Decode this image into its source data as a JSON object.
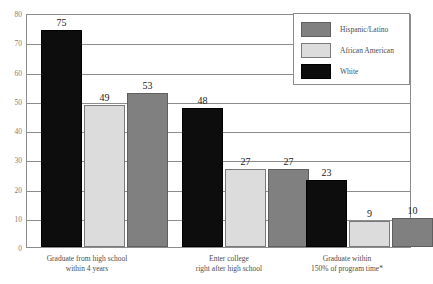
{
  "chart_data": {
    "type": "bar",
    "title": "",
    "xlabel": "",
    "ylabel": "",
    "ylim": [
      0,
      80
    ],
    "yticks": [
      0,
      10,
      20,
      30,
      40,
      50,
      60,
      70,
      80
    ],
    "grid": true,
    "legend_position": "top-right",
    "categories": [
      "Graduate from high school\nwithin 4 years",
      "Enter college\nright after high school",
      "Graduate within\n150% of program time*"
    ],
    "category_lines": [
      [
        "Graduate from high school",
        "within 4 years"
      ],
      [
        "Enter college",
        "right after high school"
      ],
      [
        "Graduate within",
        "150% of program time*"
      ]
    ],
    "series": [
      {
        "name": "White",
        "color": "#0d0d0d",
        "values": [
          75,
          48,
          23
        ]
      },
      {
        "name": "African American",
        "color": "#dcdcdc",
        "values": [
          49,
          27,
          9
        ]
      },
      {
        "name": "Hispanic/Latino",
        "color": "#808080",
        "values": [
          53,
          27,
          10
        ]
      }
    ],
    "legend_order": [
      {
        "name": "Hispanic/Latino",
        "color": "#808080"
      },
      {
        "name": "African American",
        "color": "#dcdcdc"
      },
      {
        "name": "White",
        "color": "#0d0d0d"
      }
    ]
  }
}
